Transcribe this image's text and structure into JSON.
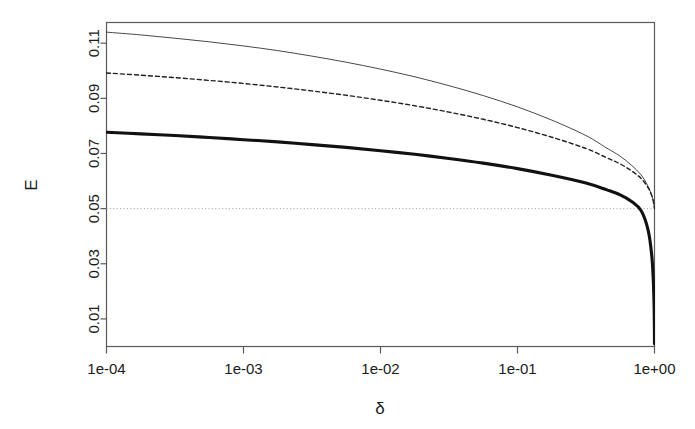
{
  "figure": {
    "background_color": "#ffffff",
    "frame_color": "#5a5a5a",
    "text_color": "#1a1a1a"
  },
  "chart_data": {
    "type": "line",
    "title": "",
    "xlabel": "δ",
    "ylabel": "E",
    "xscale": "log",
    "yscale": "linear",
    "xlim": [
      0.0001,
      1.0
    ],
    "ylim": [
      0.0,
      0.1175
    ],
    "grid": false,
    "legend": "none",
    "xtick_labels": [
      "1e-04",
      "1e-03",
      "1e-02",
      "1e-01",
      "1e+00"
    ],
    "xtick_values": [
      0.0001,
      0.001,
      0.01,
      0.1,
      1.0
    ],
    "ytick_labels": [
      "0.01",
      "0.03",
      "0.05",
      "0.07",
      "0.09",
      "0.11"
    ],
    "ytick_values": [
      0.01,
      0.03,
      0.05,
      0.07,
      0.09,
      0.11
    ],
    "x": [
      0.0001,
      0.000178,
      0.000316,
      0.000562,
      0.001,
      0.00178,
      0.00316,
      0.00562,
      0.01,
      0.0178,
      0.0316,
      0.0562,
      0.1,
      0.178,
      0.316,
      0.45,
      0.562,
      0.68,
      0.8,
      0.9,
      0.955,
      0.98,
      0.993,
      0.998,
      1.0
    ],
    "series": [
      {
        "name": "upper-thin-solid",
        "style": "solid",
        "linewidth": 0.9,
        "color": "#333333",
        "values": [
          0.114,
          0.113,
          0.1118,
          0.1105,
          0.109,
          0.1073,
          0.1053,
          0.1031,
          0.1006,
          0.0978,
          0.0946,
          0.091,
          0.0869,
          0.0821,
          0.0765,
          0.0719,
          0.069,
          0.0657,
          0.0622,
          0.058,
          0.0548,
          0.0527,
          0.0512,
          0.0504,
          0.05
        ]
      },
      {
        "name": "middle-dashed",
        "style": "dashed",
        "linewidth": 1.4,
        "color": "#222222",
        "values": [
          0.0992,
          0.0984,
          0.0975,
          0.0965,
          0.0954,
          0.0941,
          0.0927,
          0.0911,
          0.0893,
          0.0873,
          0.085,
          0.0824,
          0.0794,
          0.0759,
          0.0718,
          0.0684,
          0.0662,
          0.0637,
          0.0609,
          0.0575,
          0.0547,
          0.0527,
          0.0512,
          0.0504,
          0.05
        ]
      },
      {
        "name": "lower-thick-solid",
        "style": "solid",
        "linewidth": 3.1,
        "color": "#111111",
        "values": [
          0.0777,
          0.0771,
          0.0765,
          0.0758,
          0.075,
          0.0742,
          0.0732,
          0.0722,
          0.071,
          0.0697,
          0.0682,
          0.0665,
          0.0645,
          0.0621,
          0.0593,
          0.0568,
          0.055,
          0.0526,
          0.0492,
          0.042,
          0.033,
          0.024,
          0.015,
          0.007,
          0.001
        ]
      }
    ],
    "reference_lines": [
      {
        "name": "threshold-line",
        "orientation": "horizontal",
        "value": 0.05,
        "style": "dotted",
        "color": "#9a9a9a",
        "linewidth": 1.0
      }
    ]
  }
}
